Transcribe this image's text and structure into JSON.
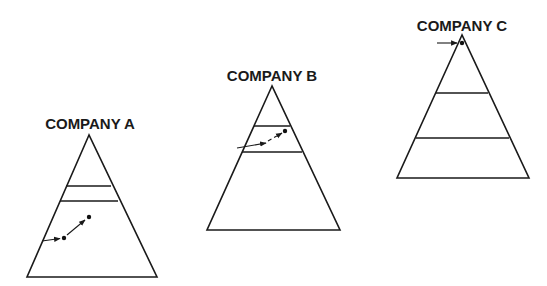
{
  "diagram": {
    "type": "pyramid-comparison",
    "companies": [
      {
        "title": "COMPANY A",
        "description": "Pyramid with two narrow tiers near the middle; a career path arrow starts outside lower-left, reaches a dot in the bottom tier, then an arrow continues up to a second dot still within the bottom tier."
      },
      {
        "title": "COMPANY B",
        "description": "Pyramid with two tiers near the top; an arrow enters from the left into the second tier and a dashed arrow continues up to a dot within that tier."
      },
      {
        "title": "COMPANY C",
        "description": "Pyramid with three tiers of roughly equal spacing; a short arrow enters from the left to a dot in the top tier."
      }
    ]
  }
}
